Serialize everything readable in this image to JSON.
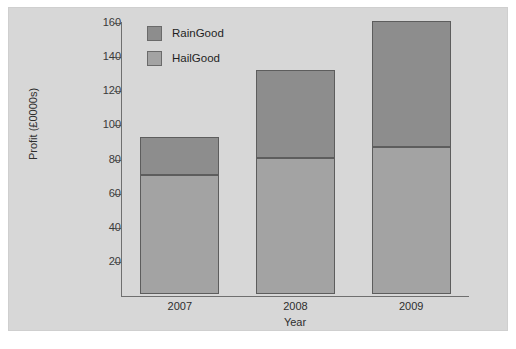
{
  "chart_data": {
    "type": "bar",
    "subtype": "stacked-bar",
    "title": "",
    "categories": [
      "2007",
      "2008",
      "2009"
    ],
    "series": [
      {
        "name": "HailGood",
        "values": [
          70,
          80,
          86
        ],
        "color": "#a3a3a3"
      },
      {
        "name": "RainGood",
        "values": [
          22,
          51,
          74
        ],
        "color": "#8d8d8d"
      }
    ],
    "totals": [
      92,
      131,
      160
    ],
    "xlabel": "Year",
    "ylabel": "Profit (£0000s)",
    "ylim": [
      0,
      160
    ],
    "yticks": [
      20,
      40,
      60,
      80,
      100,
      120,
      140,
      160
    ],
    "ytick_labels": [
      "20",
      "40",
      "60",
      "80",
      "100",
      "120",
      "140",
      "160"
    ],
    "grid": false,
    "legend_position": "top-left-inside",
    "legend_order": [
      "RainGood",
      "HailGood"
    ]
  },
  "legend": {
    "items": [
      {
        "label": "RainGood",
        "color": "#8d8d8d"
      },
      {
        "label": "HailGood",
        "color": "#a3a3a3"
      }
    ]
  },
  "axes": {
    "y_title": "Profit (£0000s)",
    "x_title": "Year"
  },
  "colors": {
    "panel_background": "#d7d7d7",
    "axis": "#6f6f6f",
    "bar_outline": "#5d5d5d",
    "text": "#2e2e2e"
  }
}
